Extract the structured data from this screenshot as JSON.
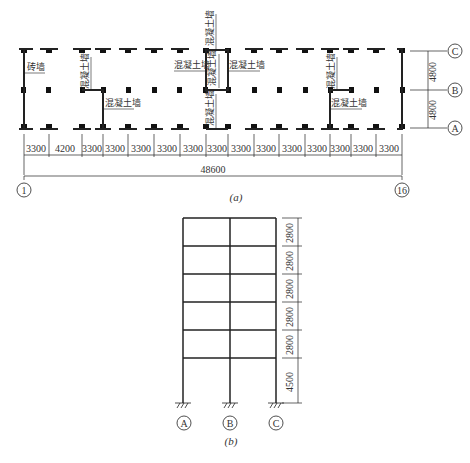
{
  "plan": {
    "caption": "(a)",
    "grid_x_labels": {
      "start": "1",
      "end": "16"
    },
    "grid_y_labels": [
      "C",
      "B",
      "A"
    ],
    "bay_dims": [
      "3300",
      "4200",
      "3300",
      "3300",
      "3300",
      "3300",
      "3300",
      "3300",
      "3300",
      "3300",
      "3300",
      "3300",
      "3300",
      "3300",
      "3300"
    ],
    "total_dim": "48600",
    "span_dims": [
      "4800",
      "4800"
    ],
    "wall_labels": {
      "brick": "砖墙",
      "concrete": "混凝土墙"
    }
  },
  "frame": {
    "caption": "(b)",
    "column_labels": [
      "A",
      "B",
      "C"
    ],
    "story_dims": [
      "2800",
      "2800",
      "2800",
      "2800",
      "2800",
      "4500"
    ]
  }
}
